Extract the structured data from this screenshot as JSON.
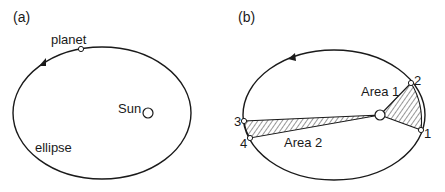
{
  "panel_a": {
    "label": "(a)",
    "planet_label": "planet",
    "sun_label": "Sun",
    "ellipse_label": "ellipse"
  },
  "panel_b": {
    "label": "(b)",
    "area1_label": "Area 1",
    "area2_label": "Area 2",
    "points": [
      "1",
      "2",
      "3",
      "4"
    ]
  },
  "colors": {
    "stroke": "#1a1a1a",
    "background": "#ffffff"
  }
}
